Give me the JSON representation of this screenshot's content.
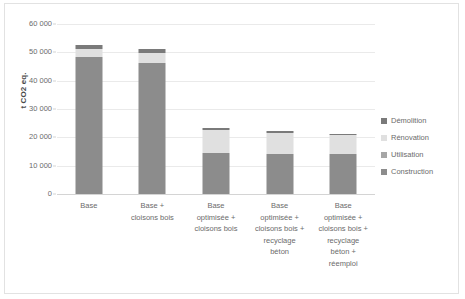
{
  "chart_data": {
    "type": "bar",
    "title": "",
    "subtitle": "",
    "stacked": true,
    "xlabel": "",
    "ylabel": "t CO2 eq.",
    "ylim": [
      0,
      60000
    ],
    "yticks": [
      "0",
      "10 000",
      "20 000",
      "30 000",
      "40 000",
      "50 000",
      "60 000"
    ],
    "ytick_values": [
      0,
      10000,
      20000,
      30000,
      40000,
      50000,
      60000
    ],
    "grid": true,
    "legend_position": "right",
    "categories": [
      "Base",
      "Base +\ncloisons bois",
      "Base\noptimisée +\ncloisons bois",
      "Base\noptimisée +\ncloisons bois +\nrecyclage\nbéton",
      "Base\noptimisée +\ncloisons bois +\nrecyclage\nbéton +\nréemploi"
    ],
    "series": [
      {
        "name": "Construction",
        "color": "#8c8c8c",
        "values": [
          48200,
          46300,
          14300,
          14200,
          14200
        ]
      },
      {
        "name": "Utilisation",
        "color": "#a6a6a6",
        "values": [
          0,
          0,
          0,
          0,
          0
        ]
      },
      {
        "name": "Rénovation",
        "color": "#e0e0e0",
        "values": [
          3000,
          3500,
          8200,
          7400,
          6800
        ]
      },
      {
        "name": "Démolition",
        "color": "#7a7a7a",
        "values": [
          1500,
          1400,
          900,
          700,
          200
        ]
      }
    ],
    "totals": [
      52700,
      51200,
      23400,
      22300,
      21200
    ]
  },
  "legend": {
    "items": [
      {
        "label": "Démolition",
        "color": "#7a7a7a"
      },
      {
        "label": "Rénovation",
        "color": "#e0e0e0"
      },
      {
        "label": "Utilisation",
        "color": "#a6a6a6"
      },
      {
        "label": "Construction",
        "color": "#8c8c8c"
      }
    ]
  },
  "axis": {
    "y_title": "t CO2 eq."
  }
}
